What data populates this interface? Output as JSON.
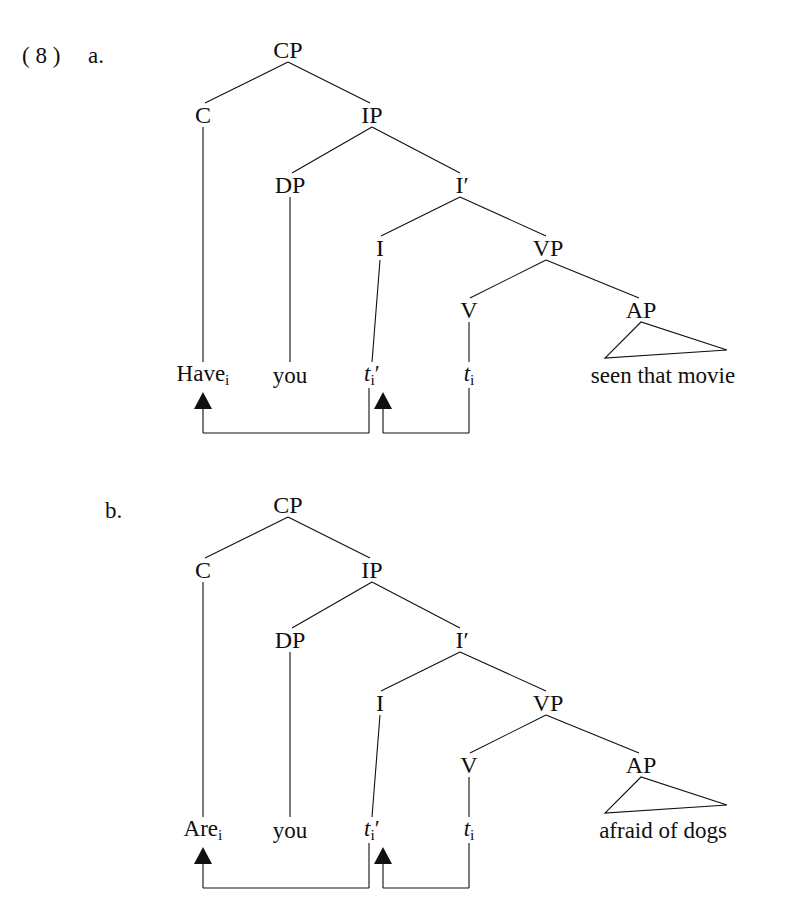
{
  "page": {
    "width": 788,
    "height": 924,
    "background": "#ffffff",
    "ink_color": "#101010",
    "example_number": "( 8 )"
  },
  "items": [
    {
      "letter": "a.",
      "letter_x": 88,
      "letter_y": 56,
      "origin_y": 0,
      "nodes": [
        {
          "name": "cp",
          "label": "CP",
          "x": 288,
          "y": 50
        },
        {
          "name": "c",
          "label": "C",
          "x": 203,
          "y": 115
        },
        {
          "name": "ip",
          "label": "IP",
          "x": 372,
          "y": 115
        },
        {
          "name": "dp",
          "label": "DP",
          "x": 290,
          "y": 185
        },
        {
          "name": "ibar",
          "label": "I",
          "prime": true,
          "x": 462,
          "y": 185
        },
        {
          "name": "i",
          "label": "I",
          "x": 380,
          "y": 248
        },
        {
          "name": "vp",
          "label": "VP",
          "x": 548,
          "y": 248
        },
        {
          "name": "v",
          "label": "V",
          "x": 469,
          "y": 310
        },
        {
          "name": "ap",
          "label": "AP",
          "x": 641,
          "y": 310
        }
      ],
      "leaves": [
        {
          "name": "leaf-c",
          "text": "Have",
          "subscript": "i",
          "x": 203,
          "y": 375
        },
        {
          "name": "leaf-dp",
          "text": "you",
          "subscript": "",
          "x": 290,
          "y": 375
        },
        {
          "name": "leaf-i",
          "text": "t",
          "subscript": "i",
          "prime": true,
          "italic": true,
          "x": 372,
          "y": 375
        },
        {
          "name": "leaf-v",
          "text": "t",
          "subscript": "i",
          "prime": false,
          "italic": true,
          "x": 469,
          "y": 375
        }
      ],
      "phrase": {
        "name": "ap-phrase",
        "text": "seen that movie",
        "x": 663,
        "y": 375
      },
      "triangle": {
        "apex_x": 641,
        "apex_y": 322,
        "left_x": 605,
        "left_y": 358,
        "right_x": 727,
        "right_y": 350
      },
      "movement_arrows": [
        {
          "name": "arrow-head-to-c",
          "from_x": 369,
          "to_x": 203,
          "bottom_y": 433,
          "head_top_y": 392
        },
        {
          "name": "arrow-v-to-i",
          "from_x": 469,
          "to_x": 383,
          "bottom_y": 433,
          "head_top_y": 392
        }
      ]
    },
    {
      "letter": "b.",
      "letter_x": 105,
      "letter_y": 511,
      "origin_y": 455,
      "nodes": [
        {
          "name": "cp",
          "label": "CP",
          "x": 288,
          "y": 505
        },
        {
          "name": "c",
          "label": "C",
          "x": 203,
          "y": 570
        },
        {
          "name": "ip",
          "label": "IP",
          "x": 372,
          "y": 570
        },
        {
          "name": "dp",
          "label": "DP",
          "x": 290,
          "y": 640
        },
        {
          "name": "ibar",
          "label": "I",
          "prime": true,
          "x": 462,
          "y": 640
        },
        {
          "name": "i",
          "label": "I",
          "x": 380,
          "y": 703
        },
        {
          "name": "vp",
          "label": "VP",
          "x": 548,
          "y": 703
        },
        {
          "name": "v",
          "label": "V",
          "x": 469,
          "y": 765
        },
        {
          "name": "ap",
          "label": "AP",
          "x": 641,
          "y": 765
        }
      ],
      "leaves": [
        {
          "name": "leaf-c",
          "text": "Are",
          "subscript": "i",
          "x": 203,
          "y": 830
        },
        {
          "name": "leaf-dp",
          "text": "you",
          "subscript": "",
          "x": 290,
          "y": 830
        },
        {
          "name": "leaf-i",
          "text": "t",
          "subscript": "i",
          "prime": true,
          "italic": true,
          "x": 372,
          "y": 830
        },
        {
          "name": "leaf-v",
          "text": "t",
          "subscript": "i",
          "prime": false,
          "italic": true,
          "x": 469,
          "y": 830
        }
      ],
      "phrase": {
        "name": "ap-phrase",
        "text": "afraid of dogs",
        "x": 663,
        "y": 830
      },
      "triangle": {
        "apex_x": 641,
        "apex_y": 777,
        "left_x": 605,
        "left_y": 813,
        "right_x": 727,
        "right_y": 805
      },
      "movement_arrows": [
        {
          "name": "arrow-head-to-c",
          "from_x": 369,
          "to_x": 203,
          "bottom_y": 888,
          "head_top_y": 847
        },
        {
          "name": "arrow-v-to-i",
          "from_x": 469,
          "to_x": 383,
          "bottom_y": 888,
          "head_top_y": 847
        }
      ]
    }
  ],
  "edges_template": [
    {
      "name": "cp-to-c",
      "x1": 288,
      "y1": 62,
      "x2": 205,
      "y2": 103
    },
    {
      "name": "cp-to-ip",
      "x1": 288,
      "y1": 62,
      "x2": 370,
      "y2": 103
    },
    {
      "name": "c-to-leaf",
      "x1": 203,
      "y1": 127,
      "x2": 203,
      "y2": 362
    },
    {
      "name": "ip-to-dp",
      "x1": 372,
      "y1": 127,
      "x2": 292,
      "y2": 173
    },
    {
      "name": "ip-to-ibar",
      "x1": 372,
      "y1": 127,
      "x2": 460,
      "y2": 173
    },
    {
      "name": "dp-to-leaf",
      "x1": 290,
      "y1": 197,
      "x2": 290,
      "y2": 362
    },
    {
      "name": "ibar-to-i",
      "x1": 460,
      "y1": 197,
      "x2": 381,
      "y2": 236
    },
    {
      "name": "ibar-to-vp",
      "x1": 460,
      "y1": 197,
      "x2": 546,
      "y2": 236
    },
    {
      "name": "i-to-leaf",
      "x1": 380,
      "y1": 260,
      "x2": 372,
      "y2": 362
    },
    {
      "name": "vp-to-v",
      "x1": 546,
      "y1": 260,
      "x2": 470,
      "y2": 298
    },
    {
      "name": "vp-to-ap",
      "x1": 546,
      "y1": 260,
      "x2": 639,
      "y2": 298
    },
    {
      "name": "v-to-leaf",
      "x1": 469,
      "y1": 322,
      "x2": 469,
      "y2": 362
    }
  ]
}
